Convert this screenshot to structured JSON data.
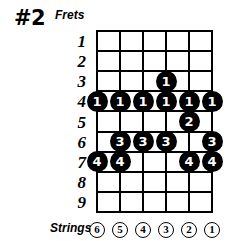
{
  "title": "#2",
  "labels": {
    "frets": "Frets",
    "strings": "Strings"
  },
  "fret_numbers": [
    "1",
    "2",
    "3",
    "4",
    "5",
    "6",
    "7",
    "8",
    "9"
  ],
  "string_numbers": [
    "6",
    "5",
    "4",
    "3",
    "2",
    "1"
  ],
  "colors": {
    "grid": "#000000",
    "dot_fill": "#000000",
    "dot_text": "#ffffff",
    "background": "#ffffff"
  },
  "chart_data": {
    "type": "table",
    "title": "#2",
    "xlabel": "Strings",
    "ylabel": "Frets",
    "categories": [
      "6",
      "5",
      "4",
      "3",
      "2",
      "1"
    ],
    "x": [
      "6",
      "5",
      "4",
      "3",
      "2",
      "1"
    ],
    "frets": [
      "1",
      "2",
      "3",
      "4",
      "5",
      "6",
      "7",
      "8",
      "9"
    ],
    "grid": true,
    "legend": "none",
    "notes": [
      {
        "fret": 3,
        "string": 3,
        "finger": "1"
      },
      {
        "fret": 4,
        "string": 6,
        "finger": "1"
      },
      {
        "fret": 4,
        "string": 5,
        "finger": "1"
      },
      {
        "fret": 4,
        "string": 4,
        "finger": "1"
      },
      {
        "fret": 4,
        "string": 3,
        "finger": "1"
      },
      {
        "fret": 4,
        "string": 2,
        "finger": "1"
      },
      {
        "fret": 4,
        "string": 1,
        "finger": "1"
      },
      {
        "fret": 5,
        "string": 2,
        "finger": "2"
      },
      {
        "fret": 6,
        "string": 5,
        "finger": "3"
      },
      {
        "fret": 6,
        "string": 4,
        "finger": "3"
      },
      {
        "fret": 6,
        "string": 3,
        "finger": "3"
      },
      {
        "fret": 6,
        "string": 1,
        "finger": "3"
      },
      {
        "fret": 7,
        "string": 6,
        "finger": "4"
      },
      {
        "fret": 7,
        "string": 5,
        "finger": "4"
      },
      {
        "fret": 7,
        "string": 2,
        "finger": "4"
      },
      {
        "fret": 7,
        "string": 1,
        "finger": "4"
      }
    ]
  },
  "geometry": {
    "grid_left": 97,
    "grid_right": 212,
    "grid_top": 31,
    "grid_bottom": 212,
    "string_spacing": 23,
    "fret_spacing": 20.11
  }
}
